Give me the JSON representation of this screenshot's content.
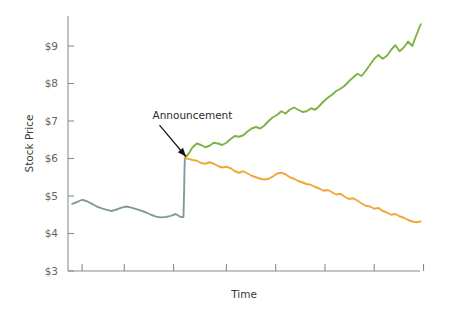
{
  "chart_data": {
    "type": "line",
    "title": "",
    "xlabel": "Time",
    "ylabel": "Stock Price",
    "ylim": [
      3,
      9.8
    ],
    "xlim": [
      0,
      100
    ],
    "grid": false,
    "legend": "none",
    "ytick_labels": [
      "$3",
      "$4",
      "$5",
      "$6",
      "$7",
      "$8",
      "$9"
    ],
    "ytick_values": [
      3,
      4,
      5,
      6,
      7,
      8,
      9
    ],
    "xtick_labels": [
      "",
      "",
      "",
      "",
      "",
      "",
      "",
      ""
    ],
    "xtick_values": [
      4,
      16,
      30,
      45,
      59,
      73,
      87,
      101
    ],
    "annotations": [
      {
        "text": "Announcement",
        "label_x": 24,
        "label_y": 7.05,
        "point_x": 33.5,
        "point_y": 6.0
      }
    ],
    "series": [
      {
        "name": "pre-announcement",
        "color": "#7f9ba0",
        "x": [
          1.2,
          2.6,
          4.0,
          5.4,
          6.8,
          8.2,
          9.6,
          11.0,
          12.4,
          13.8,
          15.2,
          16.6,
          18.0,
          19.4,
          20.8,
          22.2,
          23.6,
          25.0,
          26.4,
          27.8,
          29.2,
          30.6,
          32.0,
          32.8,
          33.0,
          33.1,
          33.2
        ],
        "y": [
          4.79,
          4.84,
          4.9,
          4.86,
          4.79,
          4.72,
          4.67,
          4.63,
          4.6,
          4.64,
          4.69,
          4.72,
          4.69,
          4.65,
          4.61,
          4.56,
          4.5,
          4.45,
          4.43,
          4.44,
          4.47,
          4.52,
          4.44,
          4.44,
          5.2,
          5.7,
          6.02
        ]
      },
      {
        "name": "positive-outcome",
        "color": "#7cb342",
        "x": [
          33.2,
          34.2,
          35.4,
          36.6,
          37.8,
          39.0,
          40.2,
          41.4,
          42.6,
          43.8,
          45.0,
          46.2,
          47.4,
          48.6,
          49.8,
          51.0,
          52.2,
          53.4,
          54.6,
          55.8,
          57.0,
          58.2,
          59.4,
          60.6,
          61.8,
          63.0,
          64.2,
          65.4,
          66.6,
          67.8,
          69.0,
          70.2,
          71.4,
          72.6,
          73.8,
          75.0,
          76.2,
          77.4,
          78.6,
          79.8,
          81.0,
          82.2,
          83.4,
          84.6,
          85.8,
          87.0,
          88.2,
          89.4,
          90.6,
          91.8,
          93.0,
          94.2,
          95.4,
          96.6,
          97.8,
          99.0,
          100.2
        ],
        "y": [
          6.02,
          6.12,
          6.3,
          6.4,
          6.36,
          6.3,
          6.34,
          6.42,
          6.4,
          6.36,
          6.42,
          6.52,
          6.6,
          6.58,
          6.62,
          6.72,
          6.8,
          6.84,
          6.8,
          6.88,
          7.0,
          7.1,
          7.16,
          7.26,
          7.2,
          7.3,
          7.36,
          7.3,
          7.24,
          7.26,
          7.34,
          7.3,
          7.4,
          7.52,
          7.62,
          7.7,
          7.8,
          7.86,
          7.94,
          8.06,
          8.16,
          8.26,
          8.2,
          8.34,
          8.5,
          8.66,
          8.76,
          8.66,
          8.74,
          8.9,
          9.02,
          8.86,
          8.96,
          9.12,
          9.0,
          9.3,
          9.58
        ]
      },
      {
        "name": "negative-outcome",
        "color": "#f0a63c",
        "x": [
          33.2,
          34.2,
          35.4,
          36.6,
          37.8,
          39.0,
          40.2,
          41.4,
          42.6,
          43.8,
          45.0,
          46.2,
          47.4,
          48.6,
          49.8,
          51.0,
          52.2,
          53.4,
          54.6,
          55.8,
          57.0,
          58.2,
          59.4,
          60.6,
          61.8,
          63.0,
          64.2,
          65.4,
          66.6,
          67.8,
          69.0,
          70.2,
          71.4,
          72.6,
          73.8,
          75.0,
          76.2,
          77.4,
          78.6,
          79.8,
          81.0,
          82.2,
          83.4,
          84.6,
          85.8,
          87.0,
          88.2,
          89.4,
          90.6,
          91.8,
          93.0,
          94.2,
          95.4,
          96.6,
          97.8,
          99.0,
          100.2
        ],
        "y": [
          6.02,
          5.99,
          5.96,
          5.94,
          5.88,
          5.86,
          5.9,
          5.86,
          5.8,
          5.76,
          5.78,
          5.74,
          5.66,
          5.62,
          5.66,
          5.6,
          5.54,
          5.5,
          5.46,
          5.44,
          5.46,
          5.52,
          5.6,
          5.62,
          5.58,
          5.5,
          5.46,
          5.4,
          5.36,
          5.32,
          5.3,
          5.24,
          5.2,
          5.14,
          5.16,
          5.1,
          5.04,
          5.06,
          4.98,
          4.92,
          4.94,
          4.88,
          4.8,
          4.74,
          4.72,
          4.66,
          4.68,
          4.6,
          4.56,
          4.5,
          4.52,
          4.46,
          4.42,
          4.36,
          4.32,
          4.3,
          4.32
        ]
      }
    ]
  },
  "colors": {
    "green": "#7cb342",
    "orange": "#f0a63c",
    "teal": "#7f9ba0",
    "axis": "#8c8c8c",
    "text": "#3f3f3f",
    "background": "#ffffff"
  }
}
